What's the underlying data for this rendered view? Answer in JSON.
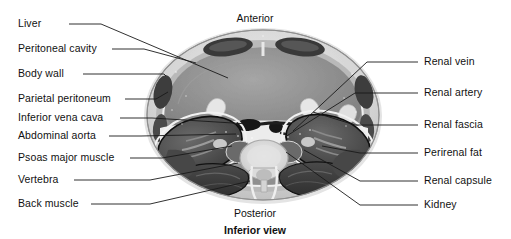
{
  "figure": {
    "title": "Inferior view",
    "view_caption": "Inferior view",
    "image_kind": "ct-cross-section-abdomen",
    "background_color": "#ffffff",
    "text_color": "#111111",
    "leader_color": "#1a1a1a"
  },
  "orientation": {
    "anterior": "Anterior",
    "posterior": "Posterior",
    "caption": "Inferior view"
  },
  "labels_left": [
    {
      "text": "Liver",
      "label_x": 18,
      "label_y": 24,
      "line_x1": 69,
      "line_y": 24,
      "line_x2": 101,
      "tip_x": 228,
      "tip_y": 78
    },
    {
      "text": "Peritoneal cavity",
      "label_x": 18,
      "label_y": 49,
      "line_x1": 112,
      "line_y": 49,
      "line_x2": 144,
      "tip_x": 196,
      "tip_y": 63
    },
    {
      "text": "Body wall",
      "label_x": 18,
      "label_y": 74,
      "line_x1": 83,
      "line_y": 74,
      "line_x2": 164,
      "tip_x": 166,
      "tip_y": 76
    },
    {
      "text": "Parietal peritoneum",
      "label_x": 18,
      "label_y": 99,
      "line_x1": 125,
      "line_y": 99,
      "line_x2": 156,
      "tip_x": 168,
      "tip_y": 92
    },
    {
      "text": "Inferior vena cava",
      "label_x": 18,
      "label_y": 118,
      "line_x1": 120,
      "line_y": 118,
      "line_x2": 152,
      "tip_x": 249,
      "tip_y": 124
    },
    {
      "text": "Abdominal aorta",
      "label_x": 18,
      "label_y": 136,
      "line_x1": 109,
      "line_y": 136,
      "line_x2": 141,
      "tip_x": 236,
      "tip_y": 134
    },
    {
      "text": "Psoas major muscle",
      "label_x": 18,
      "label_y": 158,
      "line_x1": 130,
      "line_y": 158,
      "line_x2": 162,
      "tip_x": 232,
      "tip_y": 146
    },
    {
      "text": "Vertebra",
      "label_x": 18,
      "label_y": 180,
      "line_x1": 74,
      "line_y": 180,
      "line_x2": 150,
      "tip_x": 238,
      "tip_y": 163
    },
    {
      "text": "Back muscle",
      "label_x": 18,
      "label_y": 204,
      "line_x1": 91,
      "line_y": 204,
      "line_x2": 150,
      "tip_x": 250,
      "tip_y": 181
    }
  ],
  "labels_right": [
    {
      "text": "Renal vein",
      "label_x": 424,
      "label_y": 62,
      "line_x1": 418,
      "line_y": 62,
      "line_x2": 367,
      "tip_x": 293,
      "tip_y": 131
    },
    {
      "text": "Renal artery",
      "label_x": 424,
      "label_y": 93,
      "line_x1": 418,
      "line_y": 93,
      "line_x2": 355,
      "tip_x": 285,
      "tip_y": 137
    },
    {
      "text": "Renal fascia",
      "label_x": 424,
      "label_y": 125,
      "line_x1": 418,
      "line_y": 125,
      "line_x2": 355,
      "tip_x": 313,
      "tip_y": 112
    },
    {
      "text": "Perirenal fat",
      "label_x": 424,
      "label_y": 153,
      "line_x1": 418,
      "line_y": 153,
      "line_x2": 360,
      "tip_x": 322,
      "tip_y": 146
    },
    {
      "text": "Renal capsule",
      "label_x": 424,
      "label_y": 181,
      "line_x1": 418,
      "line_y": 181,
      "line_x2": 360,
      "tip_x": 304,
      "tip_y": 150
    },
    {
      "text": "Kidney",
      "label_x": 424,
      "label_y": 205,
      "line_x1": 418,
      "line_y": 205,
      "line_x2": 360,
      "tip_x": 286,
      "tip_y": 152
    }
  ],
  "orient_positions": {
    "anterior_x": 255,
    "anterior_y": 18,
    "posterior_x": 255,
    "posterior_y": 213,
    "caption_x": 255,
    "caption_y": 230
  },
  "scan": {
    "body_ellipse": {
      "cx": 263,
      "cy": 115,
      "rx": 116,
      "ry": 85
    },
    "structures": [
      {
        "name": "skin-fat-rim",
        "tone": "#d6d6d6"
      },
      {
        "name": "rectus-abdominis-left",
        "tone": "#3c3c3c"
      },
      {
        "name": "rectus-abdominis-right",
        "tone": "#3c3c3c"
      },
      {
        "name": "liver",
        "tone": "#8e8e8e"
      },
      {
        "name": "peritoneal-cavity",
        "tone": "#9a9a9a"
      },
      {
        "name": "inferior-vena-cava",
        "tone": "#1c1c1c"
      },
      {
        "name": "abdominal-aorta",
        "tone": "#1c1c1c"
      },
      {
        "name": "kidney-left",
        "tone": "#4a4a4a"
      },
      {
        "name": "kidney-right",
        "tone": "#4a4a4a"
      },
      {
        "name": "perirenal-fat",
        "tone": "#e8e8e8"
      },
      {
        "name": "vertebral-body",
        "tone": "#d9d9d9"
      },
      {
        "name": "spinal-canal",
        "tone": "#c9c9c9"
      },
      {
        "name": "back-muscle-left",
        "tone": "#3a3a3a"
      },
      {
        "name": "back-muscle-right",
        "tone": "#3a3a3a"
      },
      {
        "name": "psoas-major-left",
        "tone": "#5a5a5a"
      },
      {
        "name": "psoas-major-right",
        "tone": "#5a5a5a"
      }
    ]
  }
}
